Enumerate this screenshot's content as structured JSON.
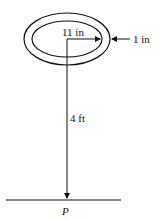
{
  "diagram": {
    "labels": {
      "radius": "11 in",
      "thickness": "1 in",
      "distance": "4 ft",
      "point": "P"
    },
    "colors": {
      "stroke": "#111111",
      "background": "#ffffff"
    }
  }
}
